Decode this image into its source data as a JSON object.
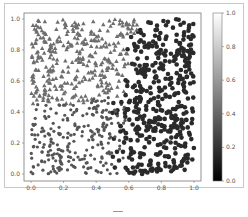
{
  "chart_data": {
    "type": "scatter",
    "title": "",
    "xlabel": "",
    "ylabel": "",
    "xlim": [
      0.0,
      1.0
    ],
    "ylim": [
      0.0,
      1.0
    ],
    "x_ticks": [
      "0.0",
      "0.2",
      "0.4",
      "0.6",
      "0.8",
      "1.0"
    ],
    "y_ticks": [
      "0.0",
      "0.2",
      "0.4",
      "0.6",
      "0.8",
      "1.0"
    ],
    "grid": false,
    "legend": null,
    "colorbar": {
      "ticks": [
        "0.0",
        "0.2",
        "0.4",
        "0.6",
        "0.8",
        "1.0"
      ],
      "range": [
        0.0,
        1.0
      ],
      "colormap": "gray",
      "position": "right"
    },
    "series": [
      {
        "name": "triangles",
        "marker": "triangle",
        "color": "#6e6e6e",
        "region": "upper-left (y > x + 0.1 approx)",
        "approx_count": 330
      },
      {
        "name": "circles",
        "marker": "circle",
        "color": "#2a2a2a",
        "region": "right (x > ~0.55)",
        "approx_count": 330
      },
      {
        "name": "dots",
        "marker": "small-circle",
        "color": "#555555",
        "region": "lower-left (y < ~0.5)",
        "approx_count": 330
      }
    ]
  },
  "caption": {
    "dash": "—"
  }
}
